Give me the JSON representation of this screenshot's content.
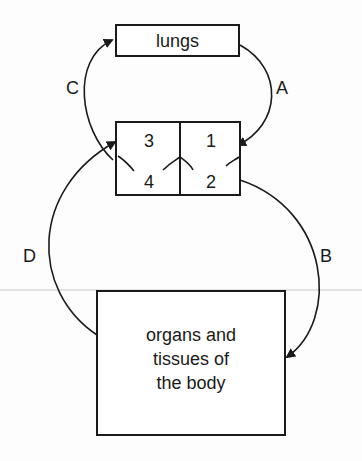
{
  "diagram": {
    "title": "",
    "nodes": {
      "lungs": {
        "label": "lungs"
      },
      "heart": {
        "chambers": [
          {
            "id": "3",
            "label": "3",
            "position": "top-left"
          },
          {
            "id": "1",
            "label": "1",
            "position": "top-right"
          },
          {
            "id": "4",
            "label": "4",
            "position": "bottom-left"
          },
          {
            "id": "2",
            "label": "2",
            "position": "bottom-right"
          }
        ]
      },
      "body": {
        "label_lines": [
          "organs and",
          "tissues of",
          "the body"
        ]
      }
    },
    "arrows": [
      {
        "label": "A",
        "from": "lungs",
        "to": "chamber-1"
      },
      {
        "label": "B",
        "from": "chamber-2",
        "to": "body"
      },
      {
        "label": "C",
        "from": "chamber-3/4 (left side)",
        "to": "lungs"
      },
      {
        "label": "D",
        "from": "body",
        "to": "chamber-3/4 (left side)"
      }
    ],
    "colors": {
      "ink": "#1a1a1a",
      "background": "#fdfdfd"
    }
  }
}
